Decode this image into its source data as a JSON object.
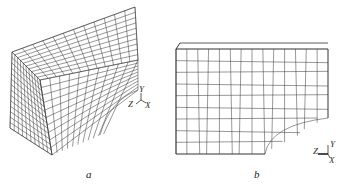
{
  "figure": {
    "panels": [
      {
        "id": "a",
        "label": "a",
        "description": "3D hexahedral mesh of block with quarter-circle cutout",
        "axes": {
          "y": "Y",
          "z": "Z",
          "x": "X"
        }
      },
      {
        "id": "b",
        "label": "b",
        "description": "2D quadrilateral mesh front face view with quarter-circle cutout",
        "axes": {
          "y": "Y",
          "z": "Z",
          "x": "X"
        }
      }
    ]
  },
  "colors": {
    "line": "#333333",
    "background": "#ffffff"
  }
}
